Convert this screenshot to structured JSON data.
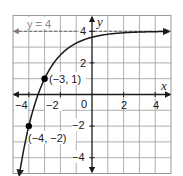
{
  "chart_data": {
    "type": "line",
    "title": "",
    "xlabel": "x",
    "ylabel": "y",
    "xlim": [
      -5,
      5
    ],
    "ylim": [
      -5,
      5
    ],
    "grid": true,
    "grid_step": 1,
    "x_tick_labels": [
      "-4",
      "-2",
      "0",
      "2",
      "4"
    ],
    "x_tick_values": [
      -4,
      -2,
      0,
      2,
      4
    ],
    "y_tick_labels": [
      "4",
      "2",
      "-2",
      "-4"
    ],
    "y_tick_values": [
      4,
      2,
      -2,
      -4
    ],
    "origin_label": "0",
    "series": [
      {
        "name": "exponential curve",
        "equation": "y = 4 - 3(1/2)^(x+3)",
        "x": [
          -4.585,
          -4,
          -3.5,
          -3,
          -2.5,
          -2,
          -1.5,
          -1,
          -0.5,
          0,
          1,
          2,
          3,
          4,
          5
        ],
        "values": [
          -5,
          -2,
          -0.243,
          1,
          1.879,
          2.5,
          2.939,
          3.25,
          3.47,
          3.625,
          3.813,
          3.906,
          3.953,
          3.977,
          3.988
        ],
        "color": "#1a1a1a"
      }
    ],
    "asymptote": {
      "label": "y = 4",
      "y": 4,
      "style": "dashed",
      "color": "#8a8a8a"
    },
    "points": [
      {
        "label": "(−3, 1)",
        "x": -3,
        "y": 1
      },
      {
        "label": "(−4, −2)",
        "x": -4,
        "y": -2
      }
    ]
  },
  "labels": {
    "x_axis": "x",
    "y_axis": "y",
    "asymptote": "y = 4",
    "origin": "0",
    "x_ticks": [
      "−4",
      "−2",
      "2",
      "4"
    ],
    "y_ticks": [
      "4",
      "2",
      "−2",
      "−4"
    ],
    "point_a": "(−3, 1)",
    "point_b": "(−4, −2)"
  }
}
